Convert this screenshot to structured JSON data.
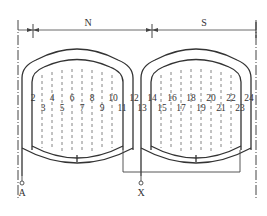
{
  "diagram": {
    "poles": [
      {
        "label": "N"
      },
      {
        "label": "S"
      }
    ],
    "slots_top": [
      "2",
      "4",
      "6",
      "8",
      "10",
      "12",
      "14",
      "16",
      "18",
      "20",
      "22",
      "24"
    ],
    "slots_bottom": [
      "3",
      "5",
      "7",
      "9",
      "11",
      "13",
      "15",
      "17",
      "19",
      "21",
      "23"
    ],
    "terminals": [
      {
        "label": "A"
      },
      {
        "label": "X"
      }
    ],
    "line_color": "#444444"
  }
}
